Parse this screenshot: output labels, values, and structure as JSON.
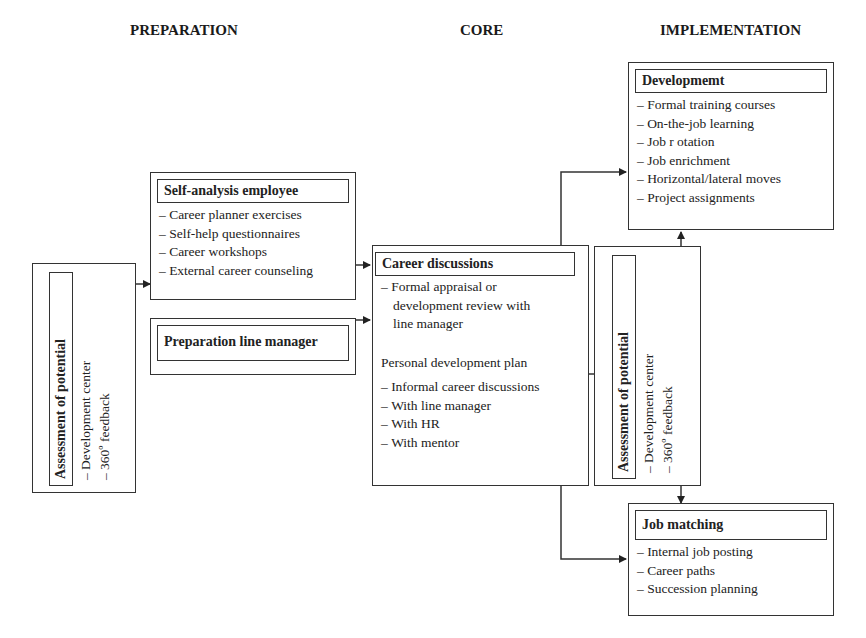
{
  "phases": {
    "preparation": "PREPARATION",
    "core": "CORE",
    "implementation": "IMPLEMENTATION"
  },
  "assessment_left": {
    "title": "Assessment of potential",
    "items": [
      "Development center",
      "360º feedback"
    ]
  },
  "self_analysis": {
    "title": "Self-analysis employee",
    "items": [
      "Career planner exercises",
      "Self-help questionnaires",
      "Career workshops",
      "External career counseling"
    ]
  },
  "prep_line_manager": {
    "title": "Preparation line manager"
  },
  "career_discussions": {
    "title": "Career discussions",
    "formal_line1": "Formal appraisal or",
    "formal_line2": "development review with",
    "formal_line3": "line manager",
    "plan": "Personal development plan",
    "items": [
      "Informal career discussions",
      "With line manager",
      "With HR",
      "With mentor"
    ]
  },
  "assessment_right": {
    "title": "Assessment of potential",
    "items": [
      "Development center",
      "360º feedback"
    ]
  },
  "development": {
    "title": "Developmemt",
    "items": [
      "Formal training courses",
      "On-the-job learning",
      "Job r otation",
      "Job enrichment",
      "Horizontal/lateral moves",
      "Project assignments"
    ]
  },
  "job_matching": {
    "title": "Job matching",
    "items": [
      "Internal job posting",
      "Career paths",
      "Succession planning"
    ]
  },
  "colors": {
    "line": "#333333",
    "background": "#ffffff",
    "text": "#222222"
  }
}
